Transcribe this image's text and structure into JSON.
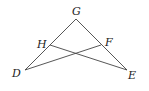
{
  "diagram": {
    "type": "geometry-triangle",
    "points": {
      "G": {
        "label": "G",
        "x": 76,
        "y": 19
      },
      "H": {
        "label": "H",
        "x": 50,
        "y": 45
      },
      "F": {
        "label": "F",
        "x": 101,
        "y": 45
      },
      "D": {
        "label": "D",
        "x": 25,
        "y": 70
      },
      "E": {
        "label": "E",
        "x": 127,
        "y": 70
      }
    },
    "segments": [
      [
        "G",
        "D"
      ],
      [
        "G",
        "E"
      ],
      [
        "H",
        "E"
      ],
      [
        "F",
        "D"
      ]
    ]
  }
}
